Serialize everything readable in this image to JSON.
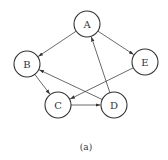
{
  "diagram": {
    "type": "directed-graph",
    "caption": "(a)",
    "nodes": [
      {
        "id": "A",
        "label": "A",
        "x": 87,
        "y": 24
      },
      {
        "id": "B",
        "label": "B",
        "x": 27,
        "y": 64
      },
      {
        "id": "C",
        "label": "C",
        "x": 58,
        "y": 105
      },
      {
        "id": "D",
        "label": "D",
        "x": 114,
        "y": 105
      },
      {
        "id": "E",
        "label": "E",
        "x": 145,
        "y": 62
      }
    ],
    "edges": [
      {
        "from": "A",
        "to": "B"
      },
      {
        "from": "A",
        "to": "E"
      },
      {
        "from": "B",
        "to": "C"
      },
      {
        "from": "C",
        "to": "D"
      },
      {
        "from": "D",
        "to": "A"
      },
      {
        "from": "D",
        "to": "B"
      },
      {
        "from": "E",
        "to": "C"
      }
    ],
    "node_radius": 13,
    "colors": {
      "stroke": "#333333",
      "background": "#ffffff"
    }
  }
}
